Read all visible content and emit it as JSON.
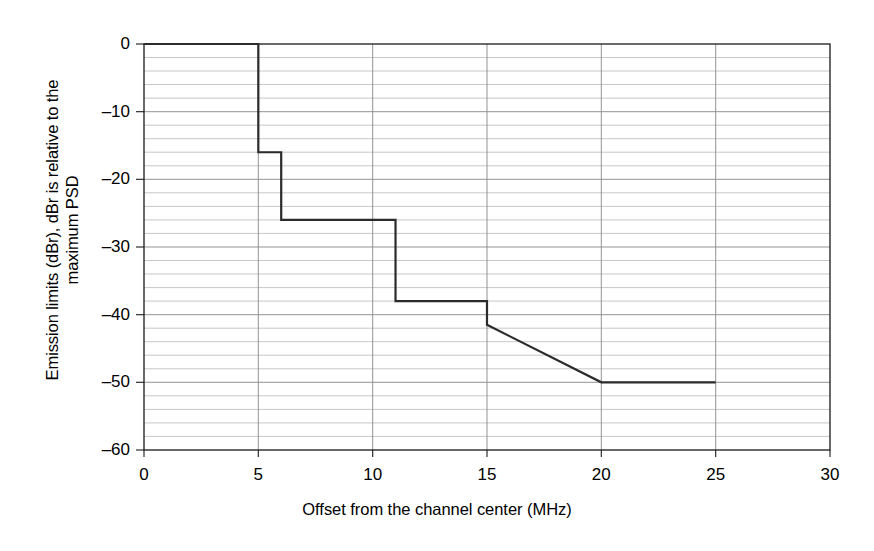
{
  "chart_data": {
    "type": "line",
    "title": "",
    "xlabel": "Offset from the channel center (MHz)",
    "ylabel_line1": "Emission limits (dBr), dBr is relative to the",
    "ylabel_line2": "maximum PSD",
    "xlim": [
      0,
      30
    ],
    "ylim": [
      -60,
      0
    ],
    "xticks": [
      0,
      5,
      10,
      15,
      20,
      25,
      30
    ],
    "xtick_labels": [
      "0",
      "5",
      "10",
      "15",
      "20",
      "25",
      "30"
    ],
    "yticks": [
      0,
      -10,
      -20,
      -30,
      -40,
      -50,
      -60
    ],
    "ytick_labels": [
      "0",
      "–10",
      "–20",
      "–30",
      "–40",
      "–50",
      "–60"
    ],
    "x_minor_step": 5,
    "y_minor_step": 2,
    "grid": true,
    "grid_color": "#9a9a9a",
    "minor_grid_color": "#b9b9b9",
    "axis_color": "#1a1a1a",
    "line_color": "#2b2b2b",
    "line_width": 2.2,
    "legend": null,
    "series": [
      {
        "name": "Spectral emission mask",
        "x": [
          0,
          5,
          5,
          6,
          6,
          11,
          11,
          15,
          15,
          20,
          25
        ],
        "y": [
          0,
          0,
          -16,
          -16,
          -26,
          -26,
          -38,
          -38,
          -41.5,
          -50,
          -50
        ]
      }
    ],
    "breakpoints": [
      {
        "offset_mhz": 0,
        "limit_dbr": 0
      },
      {
        "offset_mhz": 5,
        "limit_dbr": 0
      },
      {
        "offset_mhz": 5,
        "limit_dbr": -16
      },
      {
        "offset_mhz": 6,
        "limit_dbr": -16
      },
      {
        "offset_mhz": 6,
        "limit_dbr": -26
      },
      {
        "offset_mhz": 11,
        "limit_dbr": -26
      },
      {
        "offset_mhz": 11,
        "limit_dbr": -38
      },
      {
        "offset_mhz": 15,
        "limit_dbr": -38
      },
      {
        "offset_mhz": 15,
        "limit_dbr": -41.5
      },
      {
        "offset_mhz": 20,
        "limit_dbr": -50
      },
      {
        "offset_mhz": 25,
        "limit_dbr": -50
      }
    ]
  }
}
